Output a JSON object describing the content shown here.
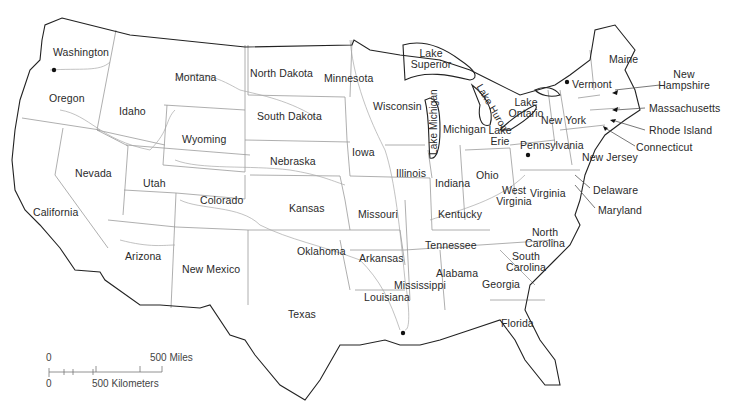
{
  "map": {
    "title": "United States (contiguous 48 states) outline map",
    "colors": {
      "background": "#ffffff",
      "border": "#222222",
      "inner_lines": "#9a9a9a",
      "label": "#2a2a2a"
    },
    "states": [
      {
        "name": "Washington",
        "x": 53,
        "y": 47
      },
      {
        "name": "Oregon",
        "x": 49,
        "y": 93
      },
      {
        "name": "Montana",
        "x": 175,
        "y": 72
      },
      {
        "name": "Idaho",
        "x": 119,
        "y": 106
      },
      {
        "name": "Wyoming",
        "x": 182,
        "y": 134
      },
      {
        "name": "Nevada",
        "x": 75,
        "y": 168
      },
      {
        "name": "Utah",
        "x": 143,
        "y": 178
      },
      {
        "name": "California",
        "x": 33,
        "y": 207
      },
      {
        "name": "Colorado",
        "x": 200,
        "y": 195
      },
      {
        "name": "Arizona",
        "x": 125,
        "y": 251
      },
      {
        "name": "New Mexico",
        "x": 182,
        "y": 264
      },
      {
        "name": "North Dakota",
        "x": 250,
        "y": 68
      },
      {
        "name": "South Dakota",
        "x": 257,
        "y": 111
      },
      {
        "name": "Nebraska",
        "x": 270,
        "y": 156
      },
      {
        "name": "Kansas",
        "x": 289,
        "y": 203
      },
      {
        "name": "Oklahoma",
        "x": 297,
        "y": 246
      },
      {
        "name": "Texas",
        "x": 288,
        "y": 309
      },
      {
        "name": "Minnesota",
        "x": 324,
        "y": 73
      },
      {
        "name": "Iowa",
        "x": 352,
        "y": 147
      },
      {
        "name": "Missouri",
        "x": 358,
        "y": 209
      },
      {
        "name": "Arkansas",
        "x": 359,
        "y": 253
      },
      {
        "name": "Louisiana",
        "x": 364,
        "y": 292
      },
      {
        "name": "Wisconsin",
        "x": 373,
        "y": 101
      },
      {
        "name": "Illinois",
        "x": 396,
        "y": 168
      },
      {
        "name": "Mississippi",
        "x": 394,
        "y": 280
      },
      {
        "name": "Michigan",
        "x": 443,
        "y": 124
      },
      {
        "name": "Indiana",
        "x": 435,
        "y": 178
      },
      {
        "name": "Kentucky",
        "x": 438,
        "y": 209
      },
      {
        "name": "Tennessee",
        "x": 425,
        "y": 240
      },
      {
        "name": "Alabama",
        "x": 436,
        "y": 268
      },
      {
        "name": "Ohio",
        "x": 476,
        "y": 170
      },
      {
        "name": "Georgia",
        "x": 482,
        "y": 279
      },
      {
        "name": "Florida",
        "x": 501,
        "y": 318
      },
      {
        "name": "New York",
        "x": 541,
        "y": 115
      },
      {
        "name": "Pennsylvania",
        "x": 520,
        "y": 140
      },
      {
        "name": "Vermont",
        "x": 572,
        "y": 79
      },
      {
        "name": "Maine",
        "x": 609,
        "y": 54
      },
      {
        "name": "New Jersey",
        "x": 582,
        "y": 152
      },
      {
        "name": "Delaware",
        "x": 593,
        "y": 185
      },
      {
        "name": "Maryland",
        "x": 598,
        "y": 205
      }
    ],
    "multiline_states": [
      {
        "lines": [
          "West",
          "Virginia"
        ],
        "x": 514,
        "y": 185
      },
      {
        "lines": [
          "North",
          "Carolina"
        ],
        "x": 545,
        "y": 227
      },
      {
        "lines": [
          "South",
          "Carolina"
        ],
        "x": 526,
        "y": 251
      },
      {
        "lines": [
          "New",
          "Hampshire"
        ],
        "x": 684,
        "y": 69
      }
    ],
    "callout_states": [
      {
        "name": "Massachusetts",
        "x": 649,
        "y": 103
      },
      {
        "name": "Rhode Island",
        "x": 649,
        "y": 125
      },
      {
        "name": "Connecticut",
        "x": 636,
        "y": 142
      },
      {
        "name": "Virginia",
        "x": 530,
        "y": 188
      }
    ],
    "lakes": [
      {
        "lines": [
          "Lake",
          "Superior"
        ],
        "x": 431,
        "y": 48
      },
      {
        "lines": [
          "Lake",
          "Ontario"
        ],
        "x": 526,
        "y": 97
      },
      {
        "lines": [
          "Lake",
          "Erie"
        ],
        "x": 500,
        "y": 125
      },
      {
        "name": "Lake Michigan",
        "x": 433,
        "y": 155,
        "rotate": -90
      },
      {
        "name": "Lake Huron",
        "x": 481,
        "y": 87,
        "rotate": 60
      }
    ],
    "scale_bar": {
      "miles_zero": "0",
      "miles_label": "500 Miles",
      "km_zero": "0",
      "km_label": "500 Kilometers"
    }
  }
}
